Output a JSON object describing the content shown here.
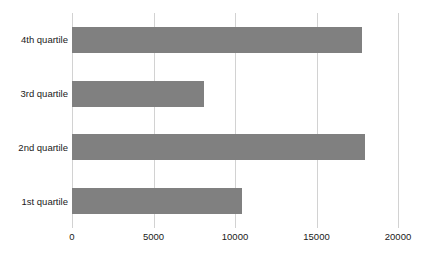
{
  "chart_data": {
    "type": "bar",
    "orientation": "horizontal",
    "title": "",
    "subtitle": "",
    "xlabel": "",
    "ylabel": "",
    "categories": [
      "1st quartile",
      "2nd quartile",
      "3rd quartile",
      "4th quartile"
    ],
    "values": [
      10430,
      17950,
      8100,
      17800
    ],
    "series": [
      {
        "name": "",
        "values": [
          10430,
          17950,
          8100,
          17800
        ]
      }
    ],
    "display_order_top_to_bottom": [
      "4th quartile",
      "3rd quartile",
      "2nd quartile",
      "1st quartile"
    ],
    "xlim": [
      0,
      20000
    ],
    "xticks": [
      0,
      5000,
      10000,
      15000,
      20000
    ],
    "xtick_labels": [
      "0",
      "5000",
      "10000",
      "15000",
      "20000"
    ],
    "grid": {
      "vertical": true,
      "horizontal": false,
      "color": "#d2d2d2"
    },
    "legend": {
      "visible": false,
      "position": "none",
      "entries": []
    },
    "colors": {
      "bar": "#808080",
      "background": "#ffffff",
      "text": "#1a1a1a",
      "gridline": "#d2d2d2"
    }
  },
  "bars": [
    {
      "label": "4th quartile",
      "value": 17800
    },
    {
      "label": "3rd quartile",
      "value": 8100
    },
    {
      "label": "2nd quartile",
      "value": 17950
    },
    {
      "label": "1st quartile",
      "value": 10430
    }
  ],
  "axis": {
    "ticks": [
      {
        "label": "0",
        "value": 0
      },
      {
        "label": "5000",
        "value": 5000
      },
      {
        "label": "10000",
        "value": 10000
      },
      {
        "label": "15000",
        "value": 15000
      },
      {
        "label": "20000",
        "value": 20000
      }
    ]
  }
}
